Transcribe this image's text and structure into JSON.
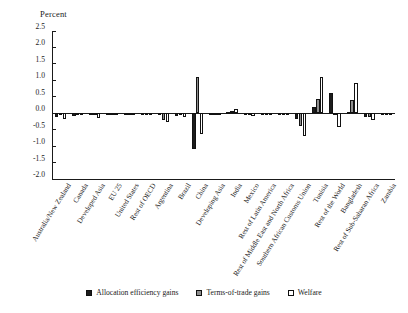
{
  "chart_data": {
    "type": "bar",
    "title": "",
    "ylabel": "Percent",
    "xlabel": "",
    "ylim": [
      -2.0,
      2.5
    ],
    "yticks": [
      2.5,
      2.0,
      1.5,
      1.0,
      0.5,
      0.0,
      -0.5,
      -1.0,
      -1.5,
      -2.0
    ],
    "ytick_labels": [
      "2.5",
      "2.0",
      "1.5",
      "1.0",
      "0.5",
      "0.0",
      "-0.5",
      "-1.0",
      "-1.5",
      "-2.0"
    ],
    "grid": false,
    "legend_position": "bottom",
    "categories": [
      "Australia/New Zealand",
      "Canada",
      "Developed Asia",
      "EU 25",
      "United States",
      "Rest of OECD",
      "Argentina",
      "Brazil",
      "China",
      "Developing Asia",
      "India",
      "Mexico",
      "Rest of Latin America",
      "Rest of Middle East and North Africa",
      "Southern African Customs Union",
      "Tunisia",
      "Rest of the World",
      "Bangladesh",
      "Rest of Sub-Saharan Africa",
      "Zambia"
    ],
    "series": [
      {
        "name": "Allocation efficiency gains",
        "color": "#1c1c1c",
        "values": [
          -0.1,
          -0.08,
          -0.05,
          -0.04,
          -0.03,
          -0.03,
          -0.06,
          -0.07,
          -1.1,
          -0.05,
          0.05,
          -0.06,
          -0.04,
          -0.05,
          -0.18,
          0.2,
          0.62,
          0.03,
          -0.1,
          -0.04
        ]
      },
      {
        "name": "Terms-of-trade gains",
        "color": "#8e8e8e",
        "values": [
          -0.06,
          -0.05,
          -0.04,
          -0.03,
          -0.02,
          -0.02,
          -0.2,
          -0.05,
          1.1,
          -0.04,
          0.08,
          -0.05,
          -0.03,
          -0.04,
          -0.38,
          0.42,
          -0.02,
          0.4,
          -0.12,
          -0.05
        ]
      },
      {
        "name": "Welfare",
        "color": "#ffffff",
        "values": [
          -0.18,
          -0.04,
          -0.16,
          -0.03,
          -0.05,
          -0.04,
          -0.26,
          -0.12,
          -0.62,
          -0.06,
          0.12,
          -0.08,
          -0.05,
          -0.06,
          -0.68,
          1.1,
          -0.42,
          0.92,
          -0.22,
          -0.06
        ]
      }
    ]
  },
  "axis": {
    "y_title": "Percent"
  },
  "legend": {
    "items": [
      {
        "label": "Allocation efficiency gains",
        "swatch": "alloc"
      },
      {
        "label": "Terms-of-trade gains",
        "swatch": "tot"
      },
      {
        "label": "Welfare",
        "swatch": "welf"
      }
    ]
  }
}
